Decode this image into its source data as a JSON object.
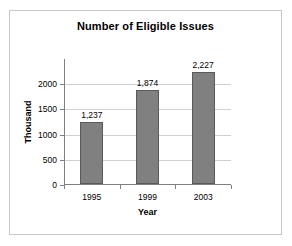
{
  "chart_data": {
    "type": "bar",
    "title": "Number of Eligible Issues",
    "xlabel": "Year",
    "ylabel": "Thousand",
    "categories": [
      "1995",
      "1999",
      "2003"
    ],
    "values": [
      1237,
      1874,
      2227
    ],
    "value_labels": [
      "1,237",
      "1,874",
      "2,227"
    ],
    "ylim": [
      0,
      2500
    ],
    "yticks": [
      0,
      500,
      1000,
      1500,
      2000
    ],
    "ytick_labels": [
      "0",
      "500",
      "1000",
      "1500",
      "2000"
    ],
    "grid": true,
    "legend": false,
    "bar_color": "#808080",
    "bar_border_color": "#5a5a5a",
    "gridline_color": "#d0d0d0",
    "axis_color": "#808080",
    "text_color": "#000000",
    "background_color": "#ffffff",
    "frame_color": "#c9c9c9"
  }
}
